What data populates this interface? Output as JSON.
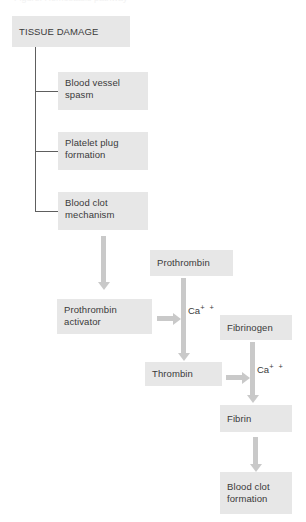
{
  "diagram": {
    "title_clipped": "Figure: Hemostasis pathway",
    "boxes": {
      "tissue_damage": "TISSUE DAMAGE",
      "blood_vessel_spasm": "Blood vessel\nspasm",
      "platelet_plug_formation": "Platelet plug\nformation",
      "blood_clot_mechanism": "Blood clot\nmechanism",
      "prothrombin": "Prothrombin",
      "prothrombin_activator": "Prothrombin\nactivator",
      "fibrinogen": "Fibrinogen",
      "thrombin": "Thrombin",
      "fibrin": "Fibrin",
      "blood_clot_formation": "Blood clot\nformation"
    },
    "labels": {
      "calcium_symbol": "Ca",
      "calcium_charge": "+ +"
    },
    "colors": {
      "box_fill": "#e7e7e7",
      "text": "#3a3a3a",
      "arrow": "#c9c9c9",
      "connector_line": "#5e5e5e",
      "background": "#ffffff"
    }
  }
}
